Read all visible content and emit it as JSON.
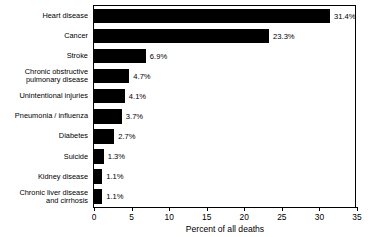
{
  "chart_data": {
    "type": "bar",
    "orientation": "horizontal",
    "title": "",
    "xlabel": "Percent of all deaths",
    "ylabel": "",
    "xlim": [
      0,
      35
    ],
    "xticks": [
      0,
      5,
      10,
      15,
      20,
      25,
      30,
      35
    ],
    "xtick_labels": [
      "0",
      "5",
      "10",
      "15",
      "20",
      "25",
      "30",
      "35"
    ],
    "grid": false,
    "legend": null,
    "bar_color": "#000000",
    "categories": [
      "Heart disease",
      "Cancer",
      "Stroke",
      "Chronic obstructive pulmonary disease",
      "Unintentional injuries",
      "Pneumonia / influenza",
      "Diabetes",
      "Suicide",
      "Kidney disease",
      "Chronic liver disease and cirrhosis"
    ],
    "values": [
      31.4,
      23.3,
      6.9,
      4.7,
      4.1,
      3.7,
      2.7,
      1.3,
      1.1,
      1.1
    ],
    "data_labels": [
      "31.4%",
      "23.3%",
      "6.9%",
      "4.7%",
      "4.1%",
      "3.7%",
      "2.7%",
      "1.3%",
      "1.1%",
      "1.1%"
    ]
  },
  "rows": [
    {
      "label_lines": [
        "Heart disease"
      ],
      "value": 31.4,
      "data_label": "31.4%"
    },
    {
      "label_lines": [
        "Cancer"
      ],
      "value": 23.3,
      "data_label": "23.3%"
    },
    {
      "label_lines": [
        "Stroke"
      ],
      "value": 6.9,
      "data_label": "6.9%"
    },
    {
      "label_lines": [
        "Chronic obstructive",
        "pulmonary disease"
      ],
      "value": 4.7,
      "data_label": "4.7%"
    },
    {
      "label_lines": [
        "Unintentional injuries"
      ],
      "value": 4.1,
      "data_label": "4.1%"
    },
    {
      "label_lines": [
        "Pneumonia / influenza"
      ],
      "value": 3.7,
      "data_label": "3.7%"
    },
    {
      "label_lines": [
        "Diabetes"
      ],
      "value": 2.7,
      "data_label": "2.7%"
    },
    {
      "label_lines": [
        "Suicide"
      ],
      "value": 1.3,
      "data_label": "1.3%"
    },
    {
      "label_lines": [
        "Kidney disease"
      ],
      "value": 1.1,
      "data_label": "1.1%"
    },
    {
      "label_lines": [
        "Chronic liver disease",
        "and cirrhosis"
      ],
      "value": 1.1,
      "data_label": "1.1%"
    }
  ]
}
